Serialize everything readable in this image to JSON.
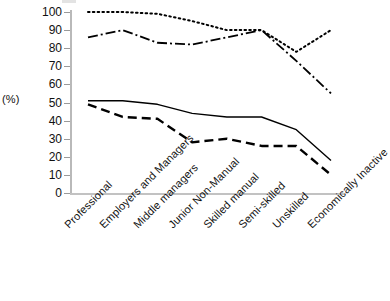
{
  "axis": {
    "y_label": "(%)",
    "y_ticks": [
      0,
      10,
      20,
      30,
      40,
      50,
      60,
      70,
      80,
      90,
      100
    ]
  },
  "chart_data": {
    "type": "line",
    "title": "",
    "xlabel": "",
    "ylabel": "(%)",
    "ylim": [
      0,
      100
    ],
    "grid": false,
    "legend": "none",
    "categories": [
      "Professional",
      "Employers and Managers",
      "Middle managers",
      "Junior Non-Manual",
      "Skilled manual",
      "Semi-skilled",
      "Unskilled",
      "Economically Inactive"
    ],
    "series": [
      {
        "name": "dotted-series",
        "style": "dotted",
        "values": [
          100,
          100,
          99,
          95,
          90,
          90,
          78,
          90
        ]
      },
      {
        "name": "dash-dot-series",
        "style": "dash-dot",
        "values": [
          86,
          90,
          83,
          82,
          86,
          90,
          73,
          55
        ]
      },
      {
        "name": "solid-series",
        "style": "solid",
        "values": [
          51,
          51,
          49,
          44,
          42,
          42,
          35,
          18
        ]
      },
      {
        "name": "dashed-series",
        "style": "dashed",
        "values": [
          49,
          42,
          41,
          28,
          30,
          26,
          26,
          10
        ]
      }
    ],
    "colors": {
      "line": "#000000",
      "axis": "#bdbdbd",
      "text": "#111111"
    }
  }
}
